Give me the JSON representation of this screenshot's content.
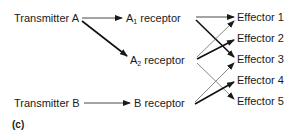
{
  "diagram": {
    "panel_label": "(c)",
    "transmitters": [
      {
        "id": "transmitter-a",
        "label": "Transmitter A"
      },
      {
        "id": "transmitter-b",
        "label": "Transmitter B"
      }
    ],
    "receptors": [
      {
        "id": "a1-receptor",
        "label_base": "A",
        "subscript": "1",
        "label_suffix": " receptor"
      },
      {
        "id": "a2-receptor",
        "label_base": "A",
        "subscript": "2",
        "label_suffix": " receptor"
      },
      {
        "id": "b-receptor",
        "label": "B receptor"
      }
    ],
    "effectors": [
      {
        "id": "effector-1",
        "label": "Effector 1"
      },
      {
        "id": "effector-2",
        "label": "Effector 2"
      },
      {
        "id": "effector-3",
        "label": "Effector 3"
      },
      {
        "id": "effector-4",
        "label": "Effector 4"
      },
      {
        "id": "effector-5",
        "label": "Effector 5"
      }
    ],
    "edges": [
      {
        "from": "Transmitter A",
        "to": "A1 receptor",
        "weight": "thin"
      },
      {
        "from": "Transmitter A",
        "to": "A2 receptor",
        "weight": "thick"
      },
      {
        "from": "Transmitter B",
        "to": "B receptor",
        "weight": "thin"
      },
      {
        "from": "A1 receptor",
        "to": "Effector 1",
        "weight": "thin"
      },
      {
        "from": "A1 receptor",
        "to": "Effector 3",
        "weight": "thick"
      },
      {
        "from": "A2 receptor",
        "to": "Effector 1",
        "weight": "thin"
      },
      {
        "from": "A2 receptor",
        "to": "Effector 2",
        "weight": "thick"
      },
      {
        "from": "A2 receptor",
        "to": "Effector 5",
        "weight": "thin"
      },
      {
        "from": "B receptor",
        "to": "Effector 3",
        "weight": "thin"
      },
      {
        "from": "B receptor",
        "to": "Effector 4",
        "weight": "thick"
      }
    ]
  }
}
